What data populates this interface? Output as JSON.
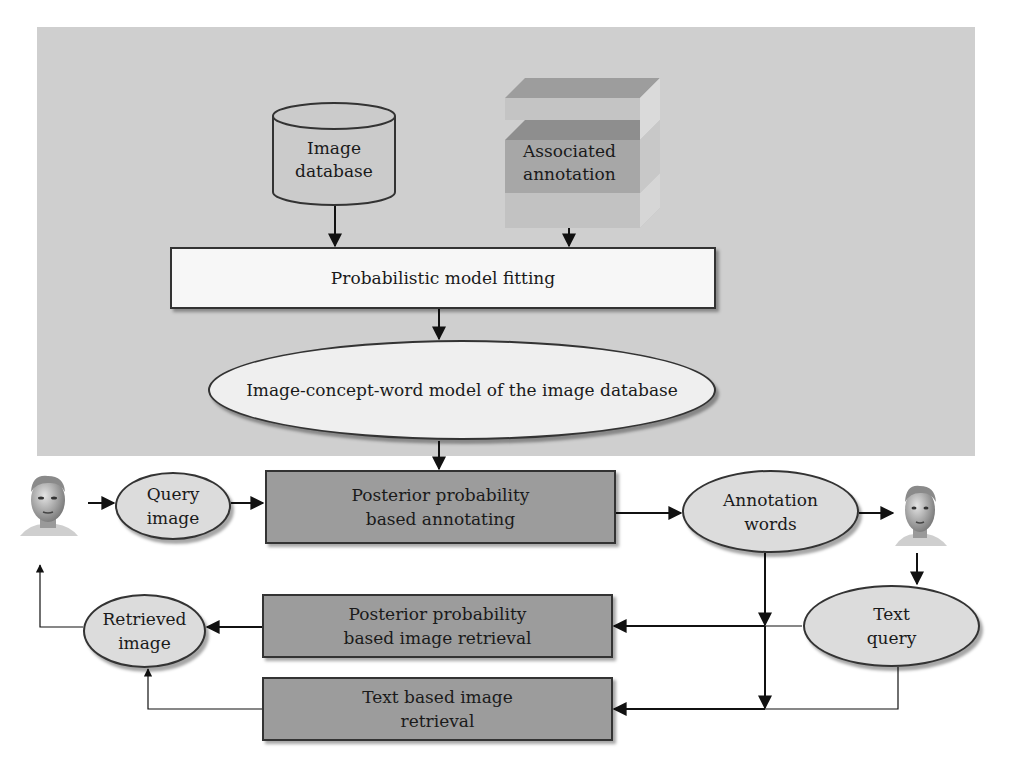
{
  "figure": {
    "nodes": {
      "image_database": "Image database",
      "image_database_l1": "Image",
      "image_database_l2": "database",
      "associated_annotation_l1": "Associated",
      "associated_annotation_l2": "annotation",
      "model_fitting": "Probabilistic model fitting",
      "icw_model": "Image-concept-word model of the image database",
      "annotating_l1": "Posterior probability",
      "annotating_l2": "based annotating",
      "query_image_l1": "Query",
      "query_image_l2": "image",
      "annotation_words_l1": "Annotation",
      "annotation_words_l2": "words",
      "text_query_l1": "Text",
      "text_query_l2": "query",
      "retrieved_image_l1": "Retrieved",
      "retrieved_image_l2": "image",
      "pp_retrieval_l1": "Posterior probability",
      "pp_retrieval_l2": "based image retrieval",
      "text_retrieval_l1": "Text based image",
      "text_retrieval_l2": "retrieval"
    },
    "icons": {
      "user_left": "user-face-icon",
      "user_right": "user-face-icon",
      "database": "cylinder-database-icon",
      "annotation_store": "layered-cube-icon"
    },
    "colors": {
      "panel": "#cfcfcf",
      "dark_box": "#9c9c9c",
      "ellipse": "#dcdcdc",
      "white_box": "#f7f7f7",
      "stroke": "#333333"
    },
    "edges": [
      {
        "from": "Image database",
        "to": "Probabilistic model fitting"
      },
      {
        "from": "Associated annotation",
        "to": "Probabilistic model fitting"
      },
      {
        "from": "Probabilistic model fitting",
        "to": "Image-concept-word model of the image database"
      },
      {
        "from": "Image-concept-word model of the image database",
        "to": "Posterior probability based annotating"
      },
      {
        "from": "User",
        "to": "Query image"
      },
      {
        "from": "Query image",
        "to": "Posterior probability based annotating"
      },
      {
        "from": "Posterior probability based annotating",
        "to": "Annotation words"
      },
      {
        "from": "Annotation words",
        "to": "User"
      },
      {
        "from": "User",
        "to": "Text query"
      },
      {
        "from": "Annotation words",
        "to": "Posterior probability based image retrieval"
      },
      {
        "from": "Annotation words",
        "to": "Text based image retrieval"
      },
      {
        "from": "Text query",
        "to": "Posterior probability based image retrieval"
      },
      {
        "from": "Text query",
        "to": "Text based image retrieval"
      },
      {
        "from": "Posterior probability based image retrieval",
        "to": "Retrieved image"
      },
      {
        "from": "Text based image retrieval",
        "to": "Retrieved image"
      },
      {
        "from": "Retrieved image",
        "to": "User"
      }
    ]
  }
}
